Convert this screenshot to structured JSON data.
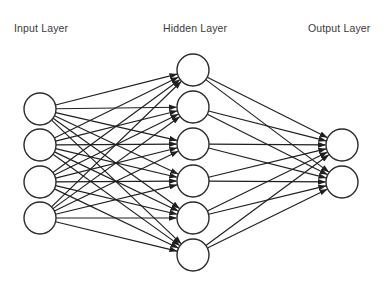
{
  "canvas": {
    "width": 392,
    "height": 289,
    "background": "#ffffff"
  },
  "diagram": {
    "type": "feedforward-neural-network",
    "edge_style": "arrow",
    "fully_connected": true,
    "colors": {
      "node_stroke": "#2b2b2b",
      "node_fill": "#ffffff",
      "edge": "#1f1f1f",
      "label_text": "#3a3a3a"
    }
  },
  "labels": {
    "input": "Input Layer",
    "hidden": "Hidden Layer",
    "output": "Output Layer",
    "y": 32,
    "input_x": 14,
    "hidden_x": 163,
    "output_x": 308
  },
  "layers": [
    {
      "id": "input",
      "name": "Input Layer",
      "node_count": 4,
      "cx": 40,
      "radius": 16,
      "nodes": [
        {
          "id": "i1",
          "cy": 109
        },
        {
          "id": "i2",
          "cy": 145
        },
        {
          "id": "i3",
          "cy": 182
        },
        {
          "id": "i4",
          "cy": 218
        }
      ]
    },
    {
      "id": "hidden",
      "name": "Hidden Layer",
      "node_count": 6,
      "cx": 193,
      "radius": 16,
      "nodes": [
        {
          "id": "h1",
          "cy": 70
        },
        {
          "id": "h2",
          "cy": 107
        },
        {
          "id": "h3",
          "cy": 144
        },
        {
          "id": "h4",
          "cy": 181
        },
        {
          "id": "h5",
          "cy": 218
        },
        {
          "id": "h6",
          "cy": 255
        }
      ]
    },
    {
      "id": "output",
      "name": "Output Layer",
      "node_count": 2,
      "cx": 342,
      "radius": 16,
      "nodes": [
        {
          "id": "o1",
          "cy": 145
        },
        {
          "id": "o2",
          "cy": 182
        }
      ]
    }
  ],
  "connections": [
    {
      "from_layer": "input",
      "to_layer": "hidden",
      "count": 24
    },
    {
      "from_layer": "hidden",
      "to_layer": "output",
      "count": 12
    }
  ]
}
